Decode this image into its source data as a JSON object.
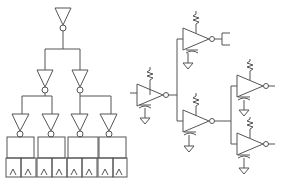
{
  "diagram": {
    "left": {
      "name": "buffer-tree",
      "levels": [
        1,
        2,
        4
      ],
      "leaf_cells": 4,
      "cells_per_leaf": 2
    },
    "right": {
      "name": "rc-buffer-tree",
      "buffers": 5
    },
    "colors": {
      "stroke": "#555555",
      "background": "#ffffff"
    }
  }
}
